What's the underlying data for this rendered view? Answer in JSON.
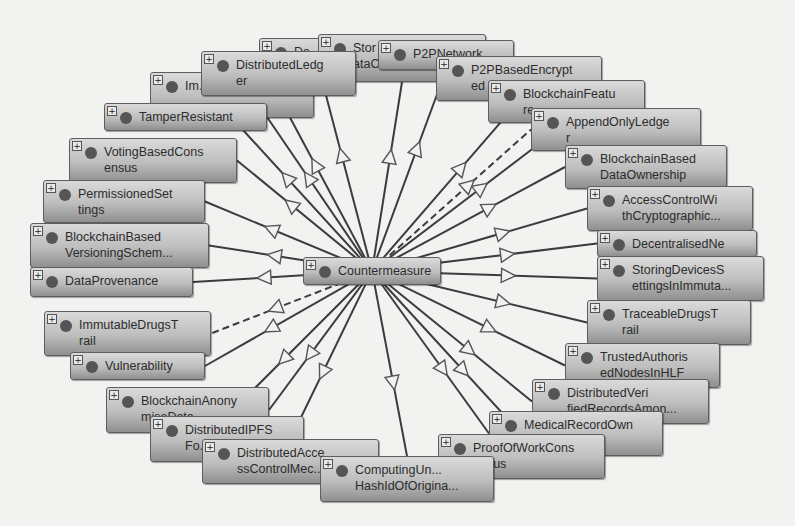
{
  "diagram": {
    "background": "#f2f2f1",
    "node_fill_top": "#dadada",
    "node_fill_bottom": "#8f8f8f",
    "edge_color": "#3c3c3c",
    "center": {
      "id": "countermeasure",
      "label": "Countermeasure",
      "x": 303,
      "y": 257,
      "w": 138,
      "h": 28
    },
    "nodes": [
      {
        "id": "n-da",
        "label": "Da...",
        "x": 259,
        "y": 38,
        "w": 126,
        "h": 42,
        "edge": "solid"
      },
      {
        "id": "n-storing-data",
        "label": "Stor\nataC...",
        "x": 318,
        "y": 34,
        "w": 168,
        "h": 48,
        "edge": "solid"
      },
      {
        "id": "n-p2p-network",
        "label": "P2PNetwork",
        "x": 378,
        "y": 40,
        "w": 136,
        "h": 30,
        "edge": "solid"
      },
      {
        "id": "n-immutable",
        "label": "Im...",
        "x": 150,
        "y": 72,
        "w": 164,
        "h": 46,
        "edge": "solid"
      },
      {
        "id": "n-distributed-ledger",
        "label": "DistributedLedg\ner",
        "x": 201,
        "y": 51,
        "w": 155,
        "h": 45,
        "edge": "solid"
      },
      {
        "id": "n-p2p-encrypted",
        "label": "P2PBasedEncrypt\ned",
        "x": 436,
        "y": 56,
        "w": 166,
        "h": 45,
        "edge": "solid"
      },
      {
        "id": "n-tamper-resistant",
        "label": "TamperResistant",
        "x": 104,
        "y": 103,
        "w": 163,
        "h": 28,
        "edge": "solid"
      },
      {
        "id": "n-blockchain-feature",
        "label": "BlockchainFeatu\nre",
        "x": 488,
        "y": 80,
        "w": 157,
        "h": 43,
        "edge": "solid"
      },
      {
        "id": "n-append-only-ledger",
        "label": "AppendOnlyLedge\nr",
        "x": 531,
        "y": 108,
        "w": 170,
        "h": 43,
        "edge": "dashed"
      },
      {
        "id": "n-voting-consensus",
        "label": "VotingBasedCons\nensus",
        "x": 69,
        "y": 138,
        "w": 168,
        "h": 45,
        "edge": "solid"
      },
      {
        "id": "n-data-ownership",
        "label": "BlockchainBased\nDataOwnership",
        "x": 565,
        "y": 145,
        "w": 162,
        "h": 44,
        "edge": "solid"
      },
      {
        "id": "n-permissioned",
        "label": "PermissionedSet\ntings",
        "x": 43,
        "y": 180,
        "w": 162,
        "h": 43,
        "edge": "solid"
      },
      {
        "id": "n-access-crypto",
        "label": "AccessControlWi\nthCryptographic...",
        "x": 587,
        "y": 186,
        "w": 166,
        "h": 45,
        "edge": "solid"
      },
      {
        "id": "n-versioning",
        "label": "BlockchainBased\nVersioningSchem...",
        "x": 30,
        "y": 223,
        "w": 179,
        "h": 45,
        "edge": "solid"
      },
      {
        "id": "n-decentralised",
        "label": "DecentralisedNe",
        "x": 597,
        "y": 230,
        "w": 160,
        "h": 27,
        "edge": "solid"
      },
      {
        "id": "n-data-provenance",
        "label": "DataProvenance",
        "x": 30,
        "y": 267,
        "w": 163,
        "h": 30,
        "edge": "solid"
      },
      {
        "id": "n-storing-devices",
        "label": "StoringDevicesS\nettingsInImmuta...",
        "x": 597,
        "y": 256,
        "w": 167,
        "h": 45,
        "edge": "solid"
      },
      {
        "id": "n-traceable-drugs",
        "label": "TraceableDrugsT\nrail",
        "x": 587,
        "y": 300,
        "w": 164,
        "h": 45,
        "edge": "solid"
      },
      {
        "id": "n-immutable-drugs",
        "label": "ImmutableDrugsT\nrail",
        "x": 44,
        "y": 311,
        "w": 167,
        "h": 45,
        "edge": "dashed"
      },
      {
        "id": "n-vulnerability",
        "label": "Vulnerability",
        "x": 70,
        "y": 352,
        "w": 135,
        "h": 28,
        "edge": "solid"
      },
      {
        "id": "n-trusted-nodes",
        "label": "TrustedAuthoris\nedNodesInHLF",
        "x": 565,
        "y": 343,
        "w": 155,
        "h": 45,
        "edge": "solid"
      },
      {
        "id": "n-distributed-verified",
        "label": "DistributedVeri\nfiedRecordsAmon...",
        "x": 532,
        "y": 379,
        "w": 177,
        "h": 45,
        "edge": "solid"
      },
      {
        "id": "n-blockchain-anonymise",
        "label": "BlockchainAnony\nmiseData",
        "x": 106,
        "y": 387,
        "w": 163,
        "h": 46,
        "edge": "solid"
      },
      {
        "id": "n-medical-record",
        "label": "MedicalRecordOwn\n...io...",
        "x": 489,
        "y": 411,
        "w": 174,
        "h": 45,
        "edge": "solid"
      },
      {
        "id": "n-distributed-ipfs",
        "label": "DistributedIPFS\nFo...",
        "x": 150,
        "y": 416,
        "w": 154,
        "h": 46,
        "edge": "solid"
      },
      {
        "id": "n-distributed-access",
        "label": "DistributedAcce\nssControlMec...",
        "x": 202,
        "y": 439,
        "w": 177,
        "h": 45,
        "edge": "solid"
      },
      {
        "id": "n-proof-of-work",
        "label": "ProofOfWorkCons\nensus",
        "x": 438,
        "y": 434,
        "w": 167,
        "h": 45,
        "edge": "solid"
      },
      {
        "id": "n-computing-hash",
        "label": "ComputingUn...\nHashIdOfOrigina...",
        "x": 320,
        "y": 456,
        "w": 174,
        "h": 46,
        "edge": "solid"
      }
    ]
  }
}
